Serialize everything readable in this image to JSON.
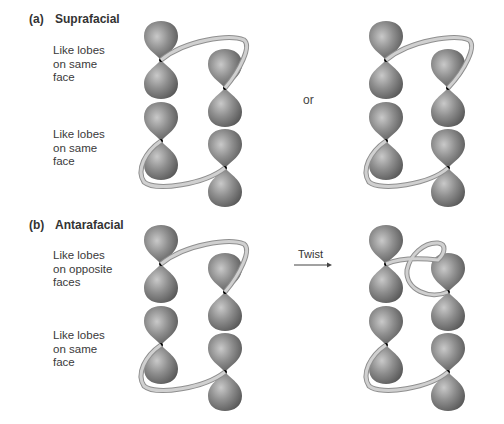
{
  "panels": [
    {
      "id": "a",
      "tag": "(a)",
      "title": "Suprafacial",
      "rows": [
        {
          "caption": "Like lobes\non same\nface"
        },
        {
          "caption": "Like lobes\non same\nface"
        }
      ],
      "connector_text": "or"
    },
    {
      "id": "b",
      "tag": "(b)",
      "title": "Antarafacial",
      "rows": [
        {
          "caption": "Like lobes\non opposite\nfaces"
        },
        {
          "caption": "Like lobes\non same\nface"
        }
      ],
      "connector_text": "Twist"
    }
  ],
  "colors": {
    "lobe_dark": "#5a5a5a",
    "lobe_mid": "#8a8a8a",
    "lobe_light": "#c4c4c4",
    "ribbon_fill": "#c8c8c8",
    "ribbon_edge": "#8f8f8f",
    "nucleus": "#000000"
  },
  "orbital_centers": {
    "a_left": [
      [
        161,
        60
      ],
      [
        225,
        88
      ],
      [
        161,
        141
      ],
      [
        225,
        168
      ]
    ],
    "a_right": [
      [
        386,
        60
      ],
      [
        448,
        88
      ],
      [
        386,
        141
      ],
      [
        448,
        168
      ]
    ],
    "b_left": [
      [
        161,
        264
      ],
      [
        225,
        292
      ],
      [
        161,
        345
      ],
      [
        225,
        372
      ]
    ],
    "b_right": [
      [
        386,
        264
      ],
      [
        448,
        292
      ],
      [
        386,
        345
      ],
      [
        448,
        372
      ]
    ]
  }
}
